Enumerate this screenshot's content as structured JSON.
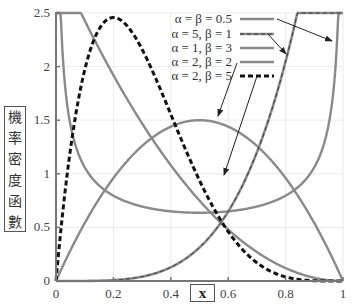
{
  "chart_data": {
    "type": "line",
    "title": "",
    "xlabel": "x",
    "ylabel": "機率密度函數",
    "xlim": [
      0,
      1
    ],
    "ylim": [
      0,
      2.5
    ],
    "x_ticks": [
      "0",
      "0.2",
      "0.4",
      "0.6",
      "0.8",
      "1"
    ],
    "y_ticks": [
      "0",
      "0.5",
      "1",
      "1.5",
      "2",
      "2.5"
    ],
    "grid": true,
    "legend_position": "upper right (inside plot)",
    "series": [
      {
        "name": "α = β = 0.5",
        "alpha": 0.5,
        "beta": 0.5,
        "style": "solid",
        "color": "#8a8a8a",
        "points": [
          [
            0.01,
            3.2
          ],
          [
            0.1,
            1.06
          ],
          [
            0.2,
            0.8
          ],
          [
            0.3,
            0.69
          ],
          [
            0.4,
            0.65
          ],
          [
            0.5,
            0.64
          ],
          [
            0.6,
            0.65
          ],
          [
            0.7,
            0.69
          ],
          [
            0.8,
            0.8
          ],
          [
            0.9,
            1.06
          ],
          [
            0.99,
            3.2
          ]
        ]
      },
      {
        "name": "α = 5, β = 1",
        "alpha": 5,
        "beta": 1,
        "style": "dashed-gray",
        "color": "#8a8a8a",
        "points": [
          [
            0,
            0
          ],
          [
            0.2,
            0.008
          ],
          [
            0.4,
            0.128
          ],
          [
            0.6,
            0.648
          ],
          [
            0.7,
            1.2
          ],
          [
            0.8,
            2.05
          ],
          [
            0.85,
            2.61
          ]
        ]
      },
      {
        "name": "α = 1, β = 3",
        "alpha": 1,
        "beta": 3,
        "style": "solid",
        "color": "#8a8a8a",
        "points": [
          [
            0,
            3
          ],
          [
            0.1,
            2.43
          ],
          [
            0.2,
            1.92
          ],
          [
            0.4,
            1.08
          ],
          [
            0.6,
            0.48
          ],
          [
            0.8,
            0.12
          ],
          [
            1,
            0
          ]
        ]
      },
      {
        "name": "α = 2, β = 2",
        "alpha": 2,
        "beta": 2,
        "style": "solid",
        "color": "#8a8a8a",
        "points": [
          [
            0,
            0
          ],
          [
            0.2,
            0.96
          ],
          [
            0.4,
            1.44
          ],
          [
            0.5,
            1.5
          ],
          [
            0.6,
            1.44
          ],
          [
            0.8,
            0.96
          ],
          [
            1,
            0
          ]
        ]
      },
      {
        "name": "α = 2, β = 5",
        "alpha": 2,
        "beta": 5,
        "style": "dashed-black",
        "color": "#111111",
        "points": [
          [
            0,
            0
          ],
          [
            0.1,
            1.97
          ],
          [
            0.2,
            2.46
          ],
          [
            0.3,
            2.16
          ],
          [
            0.4,
            1.56
          ],
          [
            0.5,
            0.94
          ],
          [
            0.6,
            0.46
          ],
          [
            0.8,
            0.05
          ],
          [
            1,
            0
          ]
        ]
      }
    ],
    "annotations": [
      "arrows from legend entries to corresponding curves"
    ]
  },
  "labels": {
    "ylabel_chars": [
      "機",
      "率",
      "密",
      "度",
      "函",
      "數"
    ],
    "xlabel": "x"
  }
}
